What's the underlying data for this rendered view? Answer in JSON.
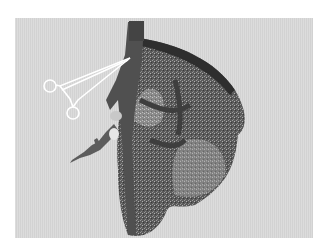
{
  "image": {
    "description": "Grayscale 3D rendering of liver parenchyma with vascular structures and a surgical clamp illustration",
    "background_color": "#d8d8d8",
    "border_color": "#ffffff",
    "elements": [
      "surgical-clamp",
      "vessel-trunk",
      "organ-mesh",
      "branching-vessel"
    ]
  }
}
